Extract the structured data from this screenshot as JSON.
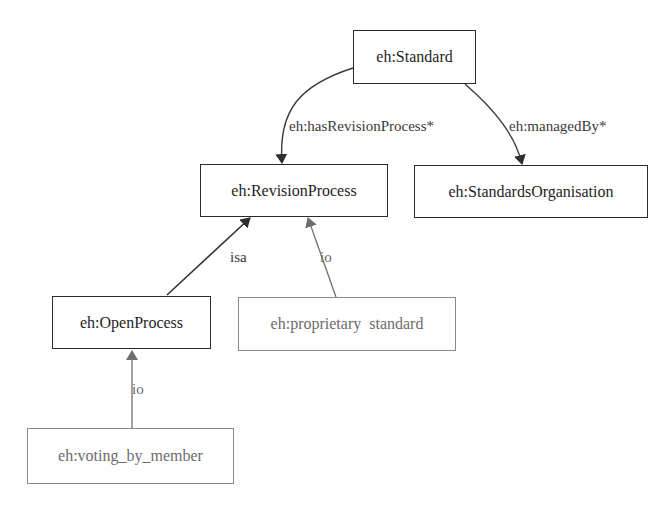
{
  "diagram": {
    "type": "ontology-graph",
    "nodes": [
      {
        "id": "standard",
        "label": "eh:Standard",
        "kind": "class"
      },
      {
        "id": "revision_process",
        "label": "eh:RevisionProcess",
        "kind": "class"
      },
      {
        "id": "standards_org",
        "label": "eh:StandardsOrganisation",
        "kind": "class"
      },
      {
        "id": "open_process",
        "label": "eh:OpenProcess",
        "kind": "class"
      },
      {
        "id": "proprietary_standard",
        "label": "eh:proprietary  standard",
        "kind": "instance"
      },
      {
        "id": "voting_by_member",
        "label": "eh:voting_by_member",
        "kind": "instance"
      }
    ],
    "edges": [
      {
        "from": "standard",
        "to": "revision_process",
        "label": "eh:hasRevisionProcess*"
      },
      {
        "from": "standard",
        "to": "standards_org",
        "label": "eh:managedBy*"
      },
      {
        "from": "open_process",
        "to": "revision_process",
        "label": "isa"
      },
      {
        "from": "proprietary_standard",
        "to": "revision_process",
        "label": "io"
      },
      {
        "from": "voting_by_member",
        "to": "open_process",
        "label": "io"
      }
    ]
  },
  "colors": {
    "class_border": "#2b2b2b",
    "instance_border": "#8a8a8a",
    "dark_edge": "#3a3a3a",
    "light_edge": "#707070"
  }
}
